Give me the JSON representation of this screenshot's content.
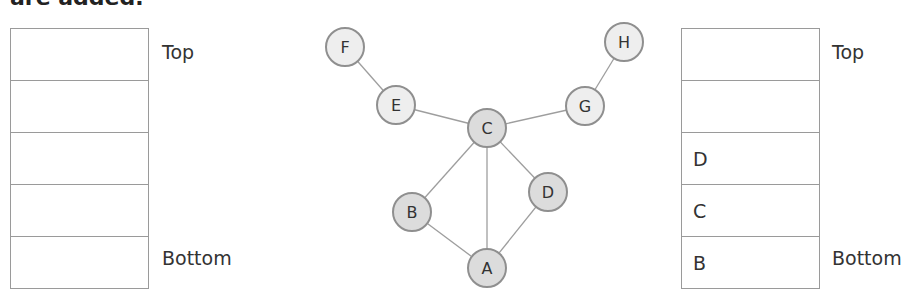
{
  "caption_fragment": "are added.",
  "left_stack": {
    "top_label": "Top",
    "bottom_label": "Bottom",
    "cells": [
      "",
      "",
      "",
      "",
      ""
    ]
  },
  "right_stack": {
    "top_label": "Top",
    "bottom_label": "Bottom",
    "cells": [
      "",
      "",
      "D",
      "C",
      "B"
    ]
  },
  "graph": {
    "nodes": [
      {
        "id": "A",
        "label": "A",
        "x": 487,
        "y": 268,
        "shade": "dark"
      },
      {
        "id": "B",
        "label": "B",
        "x": 412,
        "y": 212,
        "shade": "dark"
      },
      {
        "id": "C",
        "label": "C",
        "x": 487,
        "y": 128,
        "shade": "dark"
      },
      {
        "id": "D",
        "label": "D",
        "x": 548,
        "y": 192,
        "shade": "dark"
      },
      {
        "id": "E",
        "label": "E",
        "x": 396,
        "y": 105,
        "shade": "light"
      },
      {
        "id": "F",
        "label": "F",
        "x": 345,
        "y": 47,
        "shade": "light"
      },
      {
        "id": "G",
        "label": "G",
        "x": 585,
        "y": 106,
        "shade": "light"
      },
      {
        "id": "H",
        "label": "H",
        "x": 624,
        "y": 42,
        "shade": "light"
      }
    ],
    "edges": [
      [
        "F",
        "E"
      ],
      [
        "E",
        "C"
      ],
      [
        "C",
        "G"
      ],
      [
        "G",
        "H"
      ],
      [
        "C",
        "B"
      ],
      [
        "C",
        "A"
      ],
      [
        "C",
        "D"
      ],
      [
        "B",
        "A"
      ],
      [
        "D",
        "A"
      ]
    ],
    "colors": {
      "edge": "#9e9e9e",
      "node_stroke": "#8f8f8f",
      "node_fill_dark": "#dcdcdc",
      "node_fill_light": "#eeeeee",
      "label": "#333333"
    }
  }
}
